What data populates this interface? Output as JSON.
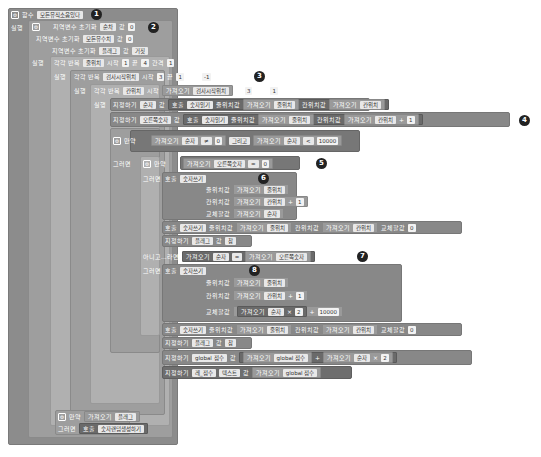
{
  "procedure": {
    "keyword": "함수",
    "name": "모든뮤직소음있다",
    "do_label": "실행"
  },
  "locals": [
    {
      "label": "지역변수 초기화",
      "name": "순차",
      "value_label": "값",
      "value": "0"
    },
    {
      "label": "지역변수 초기화",
      "name": "모든뮤수치",
      "value_label": "값",
      "value": "0"
    },
    {
      "label": "지역변수 초기화",
      "name": "플래그",
      "value_label": "값",
      "value": "거짓"
    }
  ],
  "loops": {
    "do_label": "실행",
    "outer": {
      "label": "각각 반복",
      "var": "줄위치",
      "start_label": "시작",
      "start": "1",
      "end_label": "끝",
      "end": "4",
      "step_label": "간격",
      "step": "1"
    },
    "middle": {
      "label": "각각 반복",
      "var": "검사시작위치",
      "start_label": "시작",
      "start": "3",
      "end_label": "끝",
      "end": "1",
      "step_label": "간격",
      "step": "-1"
    },
    "inner": {
      "label": "각각 반복",
      "var": "칸위치",
      "start_label": "시작",
      "get_label": "가져오기",
      "start_var": "검사시작위치",
      "end_label": "끝",
      "end": "3",
      "step_label": "간격",
      "step": "1"
    }
  },
  "body": {
    "set_label": "지정하기",
    "value_label": "값",
    "call_label": "호출",
    "get_label": "가져오기",
    "row_arg_label": "줄위치값",
    "col_arg_label": "칸위치값",
    "swap_arg_label": "교체할값",
    "set1": {
      "var": "순자",
      "proc": "숫자읽기",
      "row_var": "줄위치",
      "col_var": "칸위치"
    },
    "set2": {
      "var": "오른쪽숫자",
      "proc": "숫자읽기",
      "row_var": "줄위치",
      "col_var": "칸위치",
      "op": "+",
      "num": "1"
    },
    "if1": {
      "label": "만약",
      "a_var": "순자",
      "op": "≠",
      "a_num": "0",
      "and_label": "그리고",
      "b_var": "순자",
      "op2": "<",
      "b_num": "10000"
    },
    "then_label": "그러면",
    "if2": {
      "label": "만약",
      "var": "오른쪽숫자",
      "op": "=",
      "num": "0"
    },
    "call1": {
      "proc": "숫자쓰기",
      "row_var": "줄위치",
      "col_var": "칸위치",
      "op": "+",
      "num": "1",
      "swap_var": "순자"
    },
    "call2": {
      "proc": "숫자쓰기",
      "row_var": "줄위치",
      "col_var": "칸위치",
      "swap_num": "0"
    },
    "set_flag1": {
      "var": "플래그",
      "value": "참"
    },
    "elseif_label": "아니고...라면",
    "elseif": {
      "a_var": "순자",
      "op": "=",
      "b_var": "오른쪽숫자"
    },
    "call3": {
      "proc": "숫자쓰기",
      "row_var": "줄위치",
      "col_var": "칸위치",
      "op": "+",
      "num": "1",
      "swap_var": "순자",
      "mul": "×",
      "mul_num": "2",
      "plus": "+",
      "plus_num": "10000"
    },
    "call4": {
      "proc": "숫자쓰기",
      "row_var": "줄위치",
      "col_var": "칸위치",
      "swap_num": "0"
    },
    "set_flag2": {
      "var": "플래그",
      "value": "참"
    },
    "set_score": {
      "var": "global 점수",
      "get_var": "global 점수",
      "op": "+",
      "get_var2": "순자",
      "mul": "×",
      "num": "2"
    },
    "set_label_text": {
      "var": "레_점수",
      "prop": "텍스트",
      "get_var": "global 점수"
    }
  },
  "final_if": {
    "label": "만약",
    "get_label": "가져오기",
    "var": "플래그",
    "then_label": "그러면",
    "call_label": "호출",
    "proc": "숫자랜덤생성하기"
  },
  "callouts": [
    "1",
    "2",
    "3",
    "4",
    "5",
    "6",
    "7",
    "8"
  ]
}
